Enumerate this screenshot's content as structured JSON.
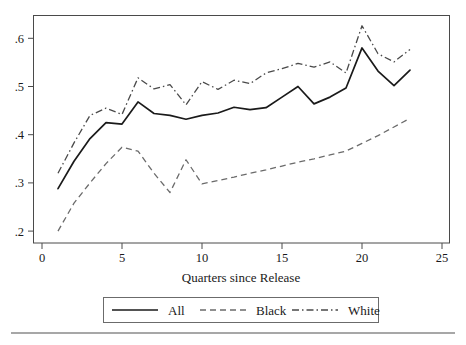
{
  "chart_data": {
    "type": "line",
    "title": "",
    "subtitle": "",
    "xlabel": "Quarters since Release",
    "ylabel": "",
    "xlim": [
      0,
      25
    ],
    "ylim": [
      0.2,
      0.63
    ],
    "grid": false,
    "legend_position": "bottom",
    "x": [
      1,
      2,
      3,
      4,
      5,
      6,
      7,
      8,
      9,
      10,
      11,
      12,
      13,
      14,
      15,
      16,
      17,
      18,
      19,
      20,
      21,
      22,
      23
    ],
    "xticks": [
      "0",
      "5",
      "10",
      "15",
      "20",
      "25"
    ],
    "xtick_values": [
      0,
      5,
      10,
      15,
      20,
      25
    ],
    "yticks": [
      ".2",
      ".3",
      ".4",
      ".5",
      ".6"
    ],
    "ytick_values": [
      0.2,
      0.3,
      0.4,
      0.5,
      0.6
    ],
    "series": [
      {
        "name": "All",
        "style": "solid",
        "color": "#1a1a1a",
        "values": [
          0.288,
          0.345,
          0.392,
          0.425,
          0.422,
          0.468,
          0.444,
          0.44,
          0.432,
          0.44,
          0.445,
          0.457,
          0.452,
          0.456,
          0.478,
          0.5,
          0.464,
          0.478,
          0.497,
          0.58,
          0.532,
          0.502,
          0.534
        ]
      },
      {
        "name": "Black",
        "style": "dashed",
        "color": "#6b6b6b",
        "values": [
          0.2,
          0.258,
          0.3,
          0.34,
          0.374,
          0.366,
          0.32,
          0.28,
          0.348,
          0.298,
          0.305,
          0.312,
          0.32,
          0.327,
          0.335,
          0.343,
          0.35,
          0.358,
          0.366,
          0.382,
          0.398,
          0.416,
          0.434
        ]
      },
      {
        "name": "White",
        "style": "dash-dot",
        "color": "#4a4a4a",
        "values": [
          0.32,
          0.383,
          0.44,
          0.455,
          0.442,
          0.518,
          0.495,
          0.504,
          0.462,
          0.51,
          0.494,
          0.513,
          0.506,
          0.528,
          0.537,
          0.548,
          0.54,
          0.551,
          0.528,
          0.626,
          0.568,
          0.551,
          0.577
        ]
      }
    ],
    "legend": [
      {
        "label": "All",
        "style": "solid"
      },
      {
        "label": "Black",
        "style": "dashed"
      },
      {
        "label": "White",
        "style": "dash-dot"
      }
    ]
  },
  "axis": {
    "x_title": "Quarters since Release",
    "x_tick_labels": [
      "0",
      "5",
      "10",
      "15",
      "20",
      "25"
    ],
    "y_tick_labels": [
      ".2",
      ".3",
      ".4",
      ".5",
      ".6"
    ]
  },
  "legend": {
    "all_label": "All",
    "black_label": "Black",
    "white_label": "White"
  },
  "colors": {
    "all": "#1a1a1a",
    "black": "#6b6b6b",
    "white": "#4a4a4a",
    "frame": "#4a4a4a",
    "background": "#ffffff"
  }
}
